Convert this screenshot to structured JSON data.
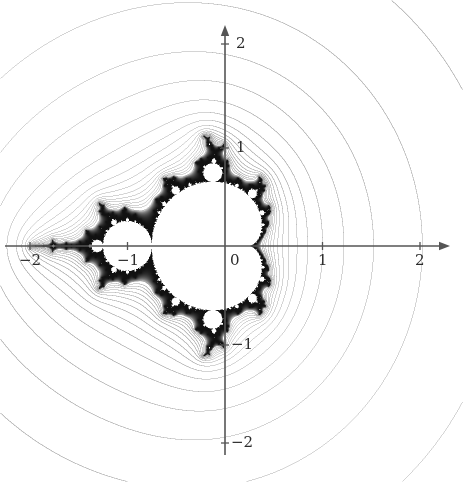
{
  "figure": {
    "width": 463,
    "height": 482,
    "background": "#ffffff",
    "title": ""
  },
  "chart_data": {
    "type": "heatmap",
    "plot_kind": "mandelbrot-set-with-equipotential-curves",
    "title": "",
    "subtitle": "",
    "xlabel": "",
    "ylabel": "",
    "xlim": [
      -2.0,
      2.0
    ],
    "ylim": [
      -2.0,
      2.0
    ],
    "grid": false,
    "legend": null,
    "axes": {
      "x_axis": {
        "pixel_y": 246,
        "pixel_x_start": 5,
        "pixel_x_end": 450,
        "arrow": "right",
        "color": "#555555",
        "line_width": 1.6,
        "tick_values": [
          -2,
          -1,
          0,
          1,
          2
        ],
        "tick_labels": [
          "−2",
          "−1",
          "0",
          "1",
          "2"
        ],
        "tick_pixels": [
          30.0,
          127.5,
          225.0,
          322.5,
          420.0
        ]
      },
      "y_axis": {
        "pixel_x": 225,
        "pixel_y_start": 455,
        "pixel_y_end": 25,
        "arrow": "up",
        "color": "#555555",
        "line_width": 1.6,
        "tick_values": [
          -2,
          -1,
          1,
          2
        ],
        "tick_labels": [
          "−2",
          "−1",
          "1",
          "2"
        ],
        "tick_pixels": [
          443.0,
          345.0,
          148.0,
          44.0
        ]
      },
      "origin_pixel": [
        225,
        246
      ],
      "pixels_per_unit_x": 97.5,
      "pixels_per_unit_y": 98.5,
      "tick_half_length": 4
    },
    "tick_label_positions": [
      {
        "text": "2",
        "axis": "y",
        "value": 2,
        "x": 236,
        "y": 36,
        "name": "y-tick-label-2"
      },
      {
        "text": "1",
        "axis": "y",
        "value": 1,
        "x": 236,
        "y": 140,
        "name": "y-tick-label-1"
      },
      {
        "text": "−1",
        "axis": "y",
        "value": -1,
        "x": 231,
        "y": 337,
        "name": "y-tick-label-neg1"
      },
      {
        "text": "−2",
        "axis": "y",
        "value": -2,
        "x": 231,
        "y": 435,
        "name": "y-tick-label-neg2"
      },
      {
        "text": "−2",
        "axis": "x",
        "value": -2,
        "x": 19,
        "y": 253,
        "name": "x-tick-label-neg2"
      },
      {
        "text": "−1",
        "axis": "x",
        "value": -1,
        "x": 117,
        "y": 253,
        "name": "x-tick-label-neg1"
      },
      {
        "text": "0",
        "axis": "x",
        "value": 0,
        "x": 230,
        "y": 253,
        "name": "x-tick-label-0"
      },
      {
        "text": "1",
        "axis": "x",
        "value": 1,
        "x": 318,
        "y": 253,
        "name": "x-tick-label-1"
      },
      {
        "text": "2",
        "axis": "x",
        "value": 2,
        "x": 415,
        "y": 253,
        "name": "x-tick-label-2"
      }
    ],
    "set": {
      "name": "Mandelbrot set",
      "formula": "z_{n+1} = z_n^2 + c,  z_0 = 0",
      "criterion": "bounded orbit",
      "fill_color": "#ffffff",
      "boundary_color": "#111111",
      "max_iterations": 220,
      "escape_radius": 2.0,
      "boundary_band_iterations": [
        18,
        220
      ],
      "features": [
        {
          "label": "main cardioid",
          "center_re": -0.25,
          "center_im": 0.0,
          "approx_width": 1.5
        },
        {
          "label": "period-2 disk",
          "center_re": -1.0,
          "center_im": 0.0,
          "radius": 0.25
        },
        {
          "label": "period-3 bulb (upper)",
          "center_re": -0.125,
          "center_im": 0.745,
          "radius": 0.095
        },
        {
          "label": "period-3 bulb (lower)",
          "center_re": -0.125,
          "center_im": -0.745,
          "radius": 0.095
        },
        {
          "label": "needle / antenna",
          "center_re": -1.75,
          "center_im": 0.0,
          "extent_re": [
            -2.0,
            -1.4
          ]
        }
      ]
    },
    "level_curves": {
      "description": "exterior equipotential (Green's function) level curves of the Mandelbrot set",
      "color": "#9a9a9a",
      "line_width": 0.7,
      "potential_levels": [
        1.34,
        1.02,
        0.78,
        0.6,
        0.46,
        0.35,
        0.27,
        0.205,
        0.155,
        0.118,
        0.089,
        0.067,
        0.05,
        0.037,
        0.028,
        0.021,
        0.015,
        0.011,
        0.008,
        0.005
      ],
      "outermost_crosses_real_axis_at": [
        -2.0,
        2.0
      ],
      "outermost_crosses_imag_axis_at": [
        -2.0,
        2.0
      ],
      "count": 20
    }
  }
}
